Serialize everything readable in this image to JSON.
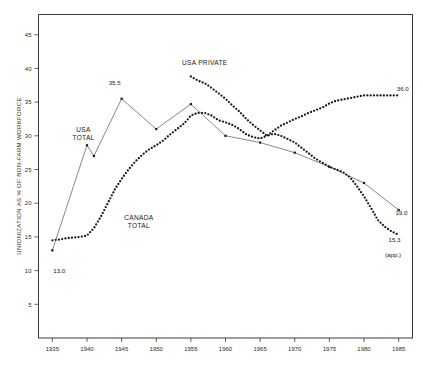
{
  "chart_data": {
    "type": "line",
    "title": "",
    "xlabel": "",
    "ylabel": "UNIONIZATION AS % OF NON-FARM WORKFORCE",
    "xlim": [
      1933,
      1987
    ],
    "ylim": [
      0,
      48
    ],
    "xticks": [
      1935,
      1940,
      1945,
      1950,
      1955,
      1960,
      1965,
      1970,
      1975,
      1980,
      1985
    ],
    "yticks": [
      5,
      10,
      15,
      20,
      25,
      30,
      35,
      40,
      45
    ],
    "grid": false,
    "legend": "inline-annotations",
    "series": [
      {
        "name": "CANADA TOTAL",
        "style": "dotted",
        "label_x": 1947.5,
        "label_y": 17.5,
        "x": [
          1935,
          1936,
          1937,
          1938,
          1939,
          1940,
          1941,
          1942,
          1943,
          1944,
          1945,
          1946,
          1947,
          1948,
          1949,
          1950,
          1951,
          1952,
          1953,
          1954,
          1955,
          1956,
          1957,
          1958,
          1959,
          1960,
          1961,
          1962,
          1963,
          1964,
          1965,
          1966,
          1967,
          1968,
          1969,
          1970,
          1971,
          1972,
          1973,
          1974,
          1975,
          1976,
          1977,
          1978,
          1979,
          1980,
          1981,
          1982,
          1983,
          1984,
          1985
        ],
        "y": [
          14.5,
          14.6,
          14.8,
          14.9,
          15.0,
          15.2,
          16.3,
          18.0,
          20.0,
          22.0,
          23.6,
          25.0,
          26.2,
          27.2,
          28.0,
          28.6,
          29.3,
          30.2,
          31.0,
          31.8,
          33.0,
          33.4,
          33.4,
          33.0,
          32.3,
          32.0,
          31.6,
          31.0,
          30.2,
          29.8,
          29.6,
          30.0,
          30.8,
          31.5,
          32.0,
          32.5,
          32.9,
          33.4,
          33.8,
          34.2,
          34.8,
          35.2,
          35.4,
          35.6,
          35.8,
          36.0,
          36.0,
          36.0,
          36.0,
          36.0,
          36.0
        ]
      },
      {
        "name": "USA TOTAL",
        "style": "solid-markers",
        "label_x": 1939.5,
        "label_y": 30.5,
        "x": [
          1935,
          1940,
          1941,
          1945,
          1950,
          1955,
          1960,
          1965,
          1970,
          1975,
          1980,
          1985
        ],
        "y": [
          13.0,
          28.6,
          27.0,
          35.5,
          31.0,
          34.7,
          30.0,
          29.0,
          27.5,
          25.4,
          23.0,
          19.0
        ]
      },
      {
        "name": "USA PRIVATE",
        "style": "dotted",
        "label_x": 1957.0,
        "label_y": 40.5,
        "x": [
          1955,
          1956,
          1957,
          1958,
          1959,
          1960,
          1961,
          1962,
          1963,
          1964,
          1965,
          1966,
          1967,
          1968,
          1969,
          1970,
          1971,
          1972,
          1973,
          1974,
          1975,
          1976,
          1977,
          1978,
          1979,
          1980,
          1981,
          1982,
          1983,
          1984,
          1985
        ],
        "y": [
          38.8,
          38.2,
          37.8,
          37.1,
          36.3,
          35.5,
          34.5,
          33.6,
          32.5,
          31.6,
          30.8,
          30.0,
          30.3,
          30.0,
          29.5,
          29.0,
          28.2,
          27.4,
          26.6,
          26.0,
          25.4,
          25.0,
          24.6,
          23.8,
          22.5,
          21.0,
          19.3,
          17.5,
          16.5,
          15.8,
          15.3
        ]
      }
    ],
    "annotations": [
      {
        "text": "13.0",
        "x": 1936.0,
        "y": 9.7,
        "name": "usa-total-1935-value"
      },
      {
        "text": "35.5",
        "x": 1944.0,
        "y": 37.6,
        "name": "usa-total-1945-value"
      },
      {
        "text": "36.0",
        "x": 1985.6,
        "y": 36.6,
        "name": "canada-total-1985-value"
      },
      {
        "text": "19.0",
        "x": 1985.4,
        "y": 18.3,
        "name": "usa-total-1985-value"
      },
      {
        "text": "15.3",
        "x": 1984.4,
        "y": 14.2,
        "name": "usa-private-1985-value"
      },
      {
        "text": "(app.)",
        "x": 1984.2,
        "y": 12.0,
        "name": "usa-private-approx-note"
      }
    ]
  }
}
